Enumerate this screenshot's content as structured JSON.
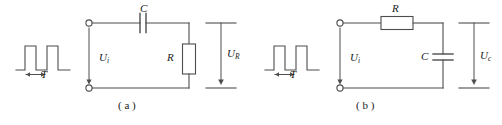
{
  "figure": {
    "stroke_color": "#4d4d4d",
    "text_color": "#1a1a1a",
    "background_color": "#ffffff"
  },
  "panels": [
    {
      "id": "a",
      "caption": "( a )",
      "source": {
        "waveform": "rectangular-pulse-train",
        "period_label": "T"
      },
      "input_label": "U",
      "input_sub": "i",
      "series_component": {
        "type": "capacitor",
        "label": "C",
        "orientation": "horizontal"
      },
      "shunt_component": {
        "type": "resistor",
        "label": "R",
        "orientation": "vertical"
      },
      "output_label": "U",
      "output_sub": "R"
    },
    {
      "id": "b",
      "caption": "( b )",
      "source": {
        "waveform": "rectangular-pulse-train",
        "period_label": "T"
      },
      "input_label": "U",
      "input_sub": "i",
      "series_component": {
        "type": "resistor",
        "label": "R",
        "orientation": "horizontal"
      },
      "shunt_component": {
        "type": "capacitor",
        "label": "C",
        "orientation": "vertical"
      },
      "output_label": "U",
      "output_sub": "c"
    }
  ]
}
